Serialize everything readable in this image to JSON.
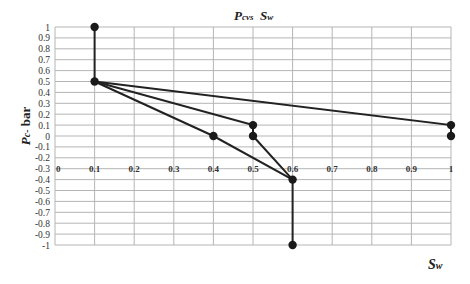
{
  "chart_data": {
    "type": "line",
    "title_parts": {
      "p": "P",
      "c": "c",
      "vs": "vs",
      "s": "S",
      "w": "w"
    },
    "xlabel": "Sw",
    "xlabel_parts": {
      "s": "S",
      "w": "w"
    },
    "ylabel": "Pc- bar",
    "ylabel_parts": {
      "p": "P",
      "c": "c-",
      "unit": "bar"
    },
    "xlim": [
      0,
      1
    ],
    "ylim": [
      -1,
      1
    ],
    "grid": true,
    "legend": null,
    "x_ticks": [
      "0",
      "0.1",
      "0.2",
      "0.3",
      "0.4",
      "0.5",
      "0.6",
      "0.7",
      "0.8",
      "0.9",
      "1"
    ],
    "y_ticks": [
      "1",
      "0.9",
      "0.8",
      "0.7",
      "0.6",
      "0.5",
      "0.4",
      "0.3",
      "0.2",
      "0.1",
      "0",
      "-0.1",
      "-0.2",
      "-0.3",
      "-0.4",
      "-0.5",
      "-0.6",
      "-0.7",
      "-0.8",
      "-0.9",
      "-1"
    ],
    "x_tick_label_row": -0.3,
    "series": [
      {
        "name": "segment-1",
        "x": [
          0.1,
          0.1
        ],
        "y": [
          1.0,
          0.5
        ]
      },
      {
        "name": "segment-2",
        "x": [
          0.1,
          1.0,
          1.0
        ],
        "y": [
          0.5,
          0.1,
          0.0
        ]
      },
      {
        "name": "segment-3",
        "x": [
          0.1,
          0.5,
          0.5,
          0.6
        ],
        "y": [
          0.5,
          0.1,
          0.0,
          -0.4
        ]
      },
      {
        "name": "segment-4",
        "x": [
          0.1,
          0.4,
          0.6,
          0.6
        ],
        "y": [
          0.5,
          0.0,
          -0.4,
          -1.0
        ]
      }
    ],
    "colors": {
      "line": "#222222",
      "marker": "#1a1a1a",
      "grid": "#b5b5b5",
      "text": "#333333"
    }
  }
}
